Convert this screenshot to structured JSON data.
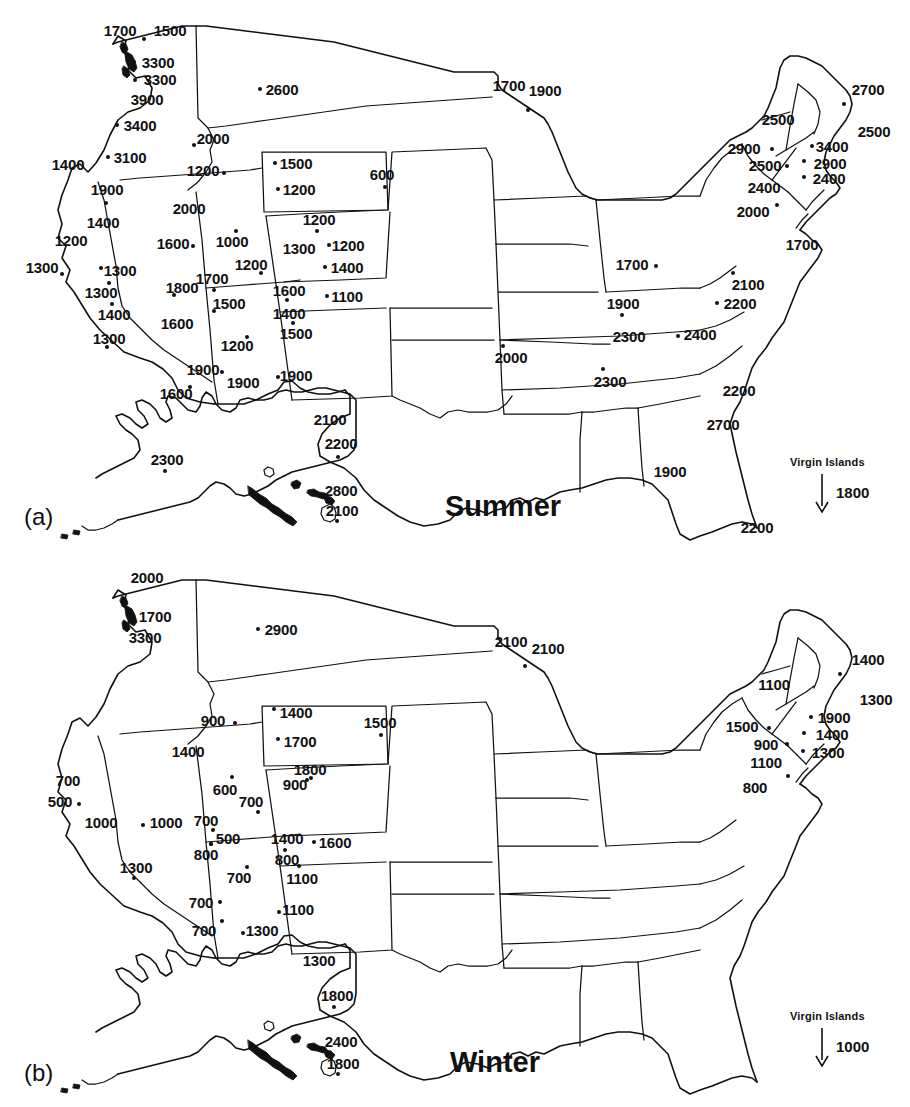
{
  "figure": {
    "background_color": "#ffffff",
    "ink_color": "#111111"
  },
  "panels": [
    {
      "tag": "(a)",
      "season_label": "Summer",
      "virgin_islands": {
        "caption": "Virgin Islands",
        "value": "1800",
        "arrow": "down-arrow-icon"
      },
      "stations": [
        {
          "value": "1700",
          "lx": 120,
          "ly": 30,
          "dot": false
        },
        {
          "value": "1500",
          "lx": 170,
          "ly": 30,
          "dx": 144,
          "dy": 39
        },
        {
          "value": "3300",
          "lx": 158,
          "ly": 62,
          "dx": 134,
          "dy": 62
        },
        {
          "value": "3300",
          "lx": 160,
          "ly": 79,
          "dx": 135,
          "dy": 80
        },
        {
          "value": "3900",
          "lx": 147,
          "ly": 99,
          "dot": false
        },
        {
          "value": "3400",
          "lx": 140,
          "ly": 125,
          "dx": 117,
          "dy": 125
        },
        {
          "value": "3100",
          "lx": 130,
          "ly": 157,
          "dx": 108,
          "dy": 157
        },
        {
          "value": "2600",
          "lx": 282,
          "ly": 89,
          "dx": 260,
          "dy": 89
        },
        {
          "value": "2000",
          "lx": 213,
          "ly": 138,
          "dx": 194,
          "dy": 145
        },
        {
          "value": "1400",
          "lx": 68,
          "ly": 164,
          "dot": false
        },
        {
          "value": "1900",
          "lx": 107,
          "ly": 189,
          "dx": 106,
          "dy": 203
        },
        {
          "value": "1400",
          "lx": 103,
          "ly": 222,
          "dot": false
        },
        {
          "value": "1200",
          "lx": 203,
          "ly": 170,
          "dx": 224,
          "dy": 173
        },
        {
          "value": "2000",
          "lx": 189,
          "ly": 208,
          "dot": false
        },
        {
          "value": "1500",
          "lx": 296,
          "ly": 163,
          "dx": 275,
          "dy": 163
        },
        {
          "value": "1200",
          "lx": 299,
          "ly": 189,
          "dx": 278,
          "dy": 189
        },
        {
          "value": "600",
          "lx": 382,
          "ly": 174,
          "dx": 385,
          "dy": 187
        },
        {
          "value": "1200",
          "lx": 319,
          "ly": 219,
          "dx": 317,
          "dy": 231
        },
        {
          "value": "1200",
          "lx": 71,
          "ly": 240,
          "dot": false
        },
        {
          "value": "1300",
          "lx": 42,
          "ly": 267,
          "dx": 62,
          "dy": 274
        },
        {
          "value": "1300",
          "lx": 120,
          "ly": 270,
          "dx": 101,
          "dy": 268
        },
        {
          "value": "1300",
          "lx": 101,
          "ly": 292,
          "dx": 109,
          "dy": 283
        },
        {
          "value": "1400",
          "lx": 114,
          "ly": 314,
          "dx": 112,
          "dy": 304
        },
        {
          "value": "1300",
          "lx": 109,
          "ly": 338,
          "dx": 107,
          "dy": 347
        },
        {
          "value": "1800",
          "lx": 182,
          "ly": 287,
          "dx": 174,
          "dy": 295
        },
        {
          "value": "1600",
          "lx": 173,
          "ly": 243,
          "dx": 193,
          "dy": 246
        },
        {
          "value": "1600",
          "lx": 177,
          "ly": 323,
          "dot": false
        },
        {
          "value": "1000",
          "lx": 232,
          "ly": 241,
          "dx": 236,
          "dy": 231
        },
        {
          "value": "1700",
          "lx": 212,
          "ly": 278,
          "dx": 214,
          "dy": 290
        },
        {
          "value": "1200",
          "lx": 251,
          "ly": 264,
          "dx": 261,
          "dy": 273
        },
        {
          "value": "1500",
          "lx": 229,
          "ly": 303,
          "dx": 214,
          "dy": 311
        },
        {
          "value": "1200",
          "lx": 237,
          "ly": 345,
          "dx": 247,
          "dy": 337
        },
        {
          "value": "1900",
          "lx": 203,
          "ly": 369,
          "dx": 222,
          "dy": 372
        },
        {
          "value": "1600",
          "lx": 176,
          "ly": 393,
          "dx": 190,
          "dy": 387
        },
        {
          "value": "1300",
          "lx": 299,
          "ly": 248,
          "dot": false
        },
        {
          "value": "1200",
          "lx": 348,
          "ly": 245,
          "dx": 329,
          "dy": 245
        },
        {
          "value": "1400",
          "lx": 347,
          "ly": 267,
          "dx": 325,
          "dy": 267
        },
        {
          "value": "1600",
          "lx": 289,
          "ly": 290,
          "dx": 287,
          "dy": 300
        },
        {
          "value": "1100",
          "lx": 347,
          "ly": 296,
          "dx": 327,
          "dy": 296
        },
        {
          "value": "1400",
          "lx": 289,
          "ly": 313,
          "dot": false
        },
        {
          "value": "1500",
          "lx": 296,
          "ly": 333,
          "dx": 293,
          "dy": 323
        },
        {
          "value": "1900",
          "lx": 296,
          "ly": 375,
          "dx": 278,
          "dy": 377
        },
        {
          "value": "1900",
          "lx": 243,
          "ly": 382,
          "dot": false
        },
        {
          "value": "2100",
          "lx": 330,
          "ly": 419,
          "dot": false
        },
        {
          "value": "2200",
          "lx": 341,
          "ly": 443,
          "dx": 338,
          "dy": 457
        },
        {
          "value": "2800",
          "lx": 341,
          "ly": 490,
          "dot": false
        },
        {
          "value": "2100",
          "lx": 342,
          "ly": 510,
          "dx": 337,
          "dy": 521
        },
        {
          "value": "2300",
          "lx": 167,
          "ly": 459,
          "dx": 165,
          "dy": 471
        },
        {
          "value": "1700",
          "lx": 509,
          "ly": 85,
          "dot": false
        },
        {
          "value": "1900",
          "lx": 545,
          "ly": 90,
          "dx": 528,
          "dy": 110
        },
        {
          "value": "2700",
          "lx": 868,
          "ly": 89,
          "dx": 844,
          "dy": 104
        },
        {
          "value": "2500",
          "lx": 778,
          "ly": 119,
          "dot": false
        },
        {
          "value": "2500",
          "lx": 874,
          "ly": 131,
          "dot": false
        },
        {
          "value": "3400",
          "lx": 832,
          "ly": 146,
          "dx": 812,
          "dy": 146
        },
        {
          "value": "2900",
          "lx": 744,
          "ly": 148,
          "dx": 772,
          "dy": 149
        },
        {
          "value": "2900",
          "lx": 830,
          "ly": 163,
          "dx": 804,
          "dy": 161
        },
        {
          "value": "2500",
          "lx": 765,
          "ly": 165,
          "dx": 787,
          "dy": 166
        },
        {
          "value": "2400",
          "lx": 829,
          "ly": 178,
          "dx": 804,
          "dy": 177
        },
        {
          "value": "2400",
          "lx": 764,
          "ly": 187,
          "dot": false
        },
        {
          "value": "2000",
          "lx": 753,
          "ly": 211,
          "dx": 777,
          "dy": 205
        },
        {
          "value": "1700",
          "lx": 802,
          "ly": 244,
          "dot": false
        },
        {
          "value": "1700",
          "lx": 632,
          "ly": 264,
          "dx": 656,
          "dy": 266
        },
        {
          "value": "2100",
          "lx": 748,
          "ly": 284,
          "dx": 733,
          "dy": 273
        },
        {
          "value": "1900",
          "lx": 623,
          "ly": 303,
          "dx": 622,
          "dy": 315
        },
        {
          "value": "2200",
          "lx": 740,
          "ly": 303,
          "dx": 717,
          "dy": 303
        },
        {
          "value": "2300",
          "lx": 629,
          "ly": 336,
          "dot": false
        },
        {
          "value": "2400",
          "lx": 700,
          "ly": 334,
          "dx": 678,
          "dy": 336
        },
        {
          "value": "2000",
          "lx": 511,
          "ly": 357,
          "dx": 503,
          "dy": 346
        },
        {
          "value": "2300",
          "lx": 610,
          "ly": 381,
          "dx": 603,
          "dy": 369
        },
        {
          "value": "2200",
          "lx": 739,
          "ly": 390,
          "dot": false
        },
        {
          "value": "2700",
          "lx": 723,
          "ly": 424,
          "dot": false
        },
        {
          "value": "1900",
          "lx": 670,
          "ly": 471,
          "dot": false
        },
        {
          "value": "2200",
          "lx": 757,
          "ly": 527,
          "dot": false
        }
      ]
    },
    {
      "tag": "(b)",
      "season_label": "Winter",
      "virgin_islands": {
        "caption": "Virgin Islands",
        "value": "1000",
        "arrow": "down-arrow-icon"
      },
      "stations": [
        {
          "value": "2000",
          "lx": 147,
          "ly": 23,
          "dot": false
        },
        {
          "value": "1700",
          "lx": 155,
          "ly": 62,
          "dx": 132,
          "dy": 62
        },
        {
          "value": "3300",
          "lx": 145,
          "ly": 83,
          "dot": false
        },
        {
          "value": "2900",
          "lx": 281,
          "ly": 75,
          "dx": 258,
          "dy": 75
        },
        {
          "value": "900",
          "lx": 213,
          "ly": 166,
          "dx": 235,
          "dy": 169
        },
        {
          "value": "1400",
          "lx": 296,
          "ly": 158,
          "dx": 274,
          "dy": 155
        },
        {
          "value": "1700",
          "lx": 300,
          "ly": 187,
          "dx": 278,
          "dy": 185
        },
        {
          "value": "1500",
          "lx": 380,
          "ly": 168,
          "dx": 381,
          "dy": 181
        },
        {
          "value": "1400",
          "lx": 188,
          "ly": 197,
          "dot": false
        },
        {
          "value": "1800",
          "lx": 310,
          "ly": 215,
          "dx": 307,
          "dy": 226
        },
        {
          "value": "600",
          "lx": 225,
          "ly": 235,
          "dx": 232,
          "dy": 223
        },
        {
          "value": "700",
          "lx": 251,
          "ly": 247,
          "dx": 258,
          "dy": 258
        },
        {
          "value": "900",
          "lx": 295,
          "ly": 230,
          "dx": 311,
          "dy": 224
        },
        {
          "value": "700",
          "lx": 206,
          "ly": 266,
          "dx": 213,
          "dy": 276
        },
        {
          "value": "700",
          "lx": 68,
          "ly": 226,
          "dot": false
        },
        {
          "value": "500",
          "lx": 60,
          "ly": 247,
          "dx": 79,
          "dy": 250
        },
        {
          "value": "1000",
          "lx": 101,
          "ly": 268,
          "dot": false
        },
        {
          "value": "1000",
          "lx": 166,
          "ly": 268,
          "dx": 143,
          "dy": 271
        },
        {
          "value": "1300",
          "lx": 136,
          "ly": 313,
          "dx": 134,
          "dy": 324
        },
        {
          "value": "500",
          "lx": 228,
          "ly": 284,
          "dx": 211,
          "dy": 290
        },
        {
          "value": "800",
          "lx": 206,
          "ly": 300,
          "dx": 211,
          "dy": 290
        },
        {
          "value": "700",
          "lx": 239,
          "ly": 323,
          "dx": 247,
          "dy": 313
        },
        {
          "value": "700",
          "lx": 201,
          "ly": 348,
          "dx": 220,
          "dy": 348
        },
        {
          "value": "700",
          "lx": 204,
          "ly": 376,
          "dx": 222,
          "dy": 367
        },
        {
          "value": "1300",
          "lx": 262,
          "ly": 376,
          "dx": 243,
          "dy": 379
        },
        {
          "value": "1400",
          "lx": 287,
          "ly": 284,
          "dx": 285,
          "dy": 296
        },
        {
          "value": "800",
          "lx": 287,
          "ly": 305,
          "dot": false
        },
        {
          "value": "1600",
          "lx": 335,
          "ly": 288,
          "dx": 314,
          "dy": 288
        },
        {
          "value": "1100",
          "lx": 302,
          "ly": 324,
          "dx": 299,
          "dy": 312
        },
        {
          "value": "1100",
          "lx": 298,
          "ly": 355,
          "dx": 279,
          "dy": 358
        },
        {
          "value": "1300",
          "lx": 319,
          "ly": 406,
          "dot": false
        },
        {
          "value": "1800",
          "lx": 337,
          "ly": 441,
          "dx": 334,
          "dy": 453
        },
        {
          "value": "2400",
          "lx": 341,
          "ly": 487,
          "dot": false
        },
        {
          "value": "1800",
          "lx": 343,
          "ly": 509,
          "dx": 338,
          "dy": 520
        },
        {
          "value": "2100",
          "lx": 511,
          "ly": 87,
          "dot": false
        },
        {
          "value": "2100",
          "lx": 548,
          "ly": 94,
          "dx": 525,
          "dy": 112
        },
        {
          "value": "1400",
          "lx": 868,
          "ly": 105,
          "dx": 840,
          "dy": 120
        },
        {
          "value": "1100",
          "lx": 774,
          "ly": 130,
          "dot": false
        },
        {
          "value": "1300",
          "lx": 876,
          "ly": 145,
          "dot": false
        },
        {
          "value": "1900",
          "lx": 834,
          "ly": 163,
          "dx": 811,
          "dy": 163
        },
        {
          "value": "1500",
          "lx": 742,
          "ly": 172,
          "dx": 769,
          "dy": 174
        },
        {
          "value": "1400",
          "lx": 832,
          "ly": 180,
          "dx": 804,
          "dy": 179
        },
        {
          "value": "900",
          "lx": 766,
          "ly": 190,
          "dx": 787,
          "dy": 190
        },
        {
          "value": "1300",
          "lx": 828,
          "ly": 198,
          "dx": 803,
          "dy": 197
        },
        {
          "value": "1100",
          "lx": 766,
          "ly": 208,
          "dot": false
        },
        {
          "value": "800",
          "lx": 755,
          "ly": 233,
          "dx": 788,
          "dy": 222
        },
        {
          "value": "700",
          "lx": 796,
          "ly": 832,
          "dot": false
        },
        {
          "value": "500",
          "lx": 681,
          "ly": 806,
          "dx": 705,
          "dy": 809
        },
        {
          "value": "700",
          "lx": 725,
          "ly": 838,
          "dot": false
        },
        {
          "value": "700",
          "lx": 620,
          "ly": 849,
          "dx": 619,
          "dy": 861
        },
        {
          "value": "500",
          "lx": 742,
          "ly": 848,
          "dx": 719,
          "dy": 846
        },
        {
          "value": "800",
          "lx": 635,
          "ly": 879,
          "dot": false
        },
        {
          "value": "1000",
          "lx": 702,
          "ly": 877,
          "dx": 680,
          "dy": 879
        },
        {
          "value": "1200",
          "lx": 511,
          "ly": 901,
          "dx": 503,
          "dy": 890
        },
        {
          "value": "900",
          "lx": 604,
          "ly": 925,
          "dx": 601,
          "dy": 913
        },
        {
          "value": "800",
          "lx": 735,
          "ly": 932,
          "dot": false
        },
        {
          "value": "1000",
          "lx": 718,
          "ly": 966,
          "dot": false
        },
        {
          "value": "900",
          "lx": 668,
          "ly": 1013,
          "dot": false
        },
        {
          "value": "1400",
          "lx": 757,
          "ly": 1068,
          "dot": false
        }
      ]
    }
  ]
}
